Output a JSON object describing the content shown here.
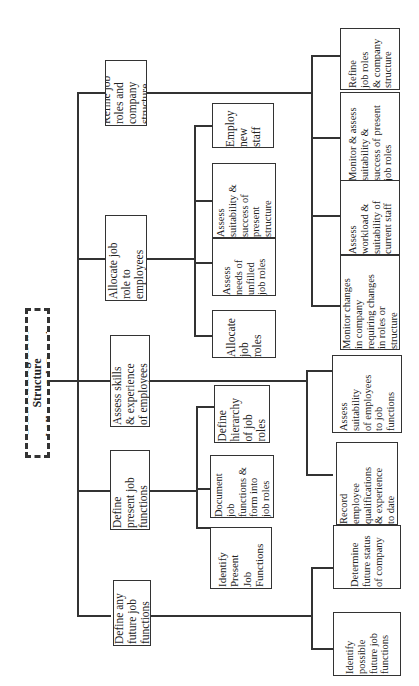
{
  "diagram": {
    "title": "Define Management Structure and Allocate Job Functions",
    "orientation": "rotated-90-ccw",
    "root": {
      "label": "Define Management Structure\nand Allocate Job Functions",
      "style": "dashed"
    },
    "level2": [
      {
        "label": "Refine job\nroles and\ncompany\nstructure",
        "children": [
          {
            "label": "Refine\njob roles\n& company\nstructure"
          },
          {
            "label": "Monitor & assess\nsuitability &\nsuccess of present\njob roles"
          },
          {
            "label": "Assess\nworkload &\nsuitability of\ncurrent staff"
          },
          {
            "label": "Monitor changes\nin company\nrequiring changes\nin roles or\nstructure"
          }
        ]
      },
      {
        "label": "Allocate job\nrole to\nemployees",
        "children": [
          {
            "label": "Employ\nnew\nstaff"
          },
          {
            "label": "Assess\nsuitability &\nsuccess of\npresent\nstructure"
          },
          {
            "label": "Assess\nneeds of\nunfilled\njob roles"
          },
          {
            "label": "Allocate\njob\nroles"
          }
        ]
      },
      {
        "label": "Assess skills\n& experience\nof employees",
        "children": [
          {
            "label": "Assess\nsuitability\nof employees\nto job\nfunctions"
          },
          {
            "label": "Record\nemployee\nqualifications\n& experience\nto date"
          }
        ]
      },
      {
        "label": "Define\npresent job\nfunctions",
        "children": [
          {
            "label": "Define\nhierarchy\nof job\nroles"
          },
          {
            "label": "Document\njob\nfunctions &\nform into\njob roles"
          },
          {
            "label": "Identify\nPresent\nJob\nFunctions"
          }
        ]
      },
      {
        "label": "Define any\nfuture job\nfunctions",
        "children": [
          {
            "label": "Determine\nfuture status\nof company"
          },
          {
            "label": "Identify\npossible\nfuture job\nfunctions"
          }
        ]
      }
    ]
  }
}
